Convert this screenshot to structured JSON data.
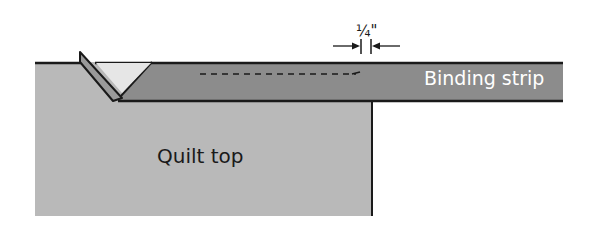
{
  "diagram": {
    "labels": {
      "binding_strip": "Binding strip",
      "quilt_top": "Quilt top",
      "seam_allowance": "¼\""
    },
    "colors": {
      "quilt_top_fill": "#b9b9b9",
      "binding_strip_fill": "#8c8c8c",
      "fold_fill": "#9a9a9a",
      "folded_triangle_fill": "#e6e6e6",
      "outline": "#1a1a1a",
      "binding_text": "#ffffff",
      "quilt_text": "#1a1a1a"
    }
  }
}
